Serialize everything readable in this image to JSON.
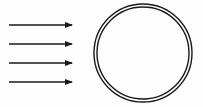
{
  "diagram": {
    "description": "Four parallel horizontal arrows pointing right toward a double-walled circle",
    "arrows": [
      {
        "x1": 9,
        "x2": 72,
        "y": 25
      },
      {
        "x1": 9,
        "x2": 72,
        "y": 44
      },
      {
        "x1": 9,
        "x2": 72,
        "y": 63
      },
      {
        "x1": 9,
        "x2": 72,
        "y": 82
      }
    ],
    "circle": {
      "cx": 143,
      "cy": 53,
      "outer_radius": 49,
      "inner_radius": 46,
      "style": "double-line"
    },
    "colors": {
      "stroke": "#1a1a1a",
      "background": "#fdfdfd"
    }
  }
}
